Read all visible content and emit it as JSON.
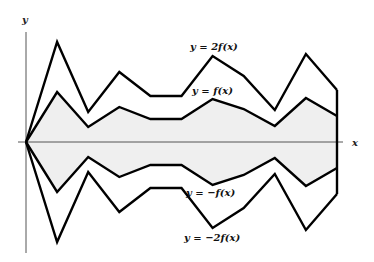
{
  "chart_data": {
    "type": "line",
    "title": "",
    "xlabel": "x",
    "ylabel": "y",
    "grid": false,
    "x": [
      0,
      1,
      2,
      3,
      4,
      5,
      6,
      7,
      8,
      9,
      10
    ],
    "f_values": [
      0,
      50,
      15,
      35,
      23,
      23,
      43,
      33,
      16,
      44,
      26
    ],
    "series": [
      {
        "name": "y = 2f(x)",
        "scale": 2
      },
      {
        "name": "y = f(x)",
        "scale": 1
      },
      {
        "name": "y = -f(x)",
        "scale": -1
      },
      {
        "name": "y = -2f(x)",
        "scale": -2
      }
    ],
    "fill_between": [
      "y = f(x)",
      "y = -f(x)"
    ],
    "fill_color": "#efefef",
    "line_color": "#000000",
    "axis_color": "#555555"
  },
  "labels": {
    "x_axis": "x",
    "y_axis": "y",
    "two_f": "y = 2f(x)",
    "f": "y = f(x)",
    "neg_f": "y = −f(x)",
    "neg_two_f": "y = −2f(x)"
  },
  "layout": {
    "origin_px": [
      26,
      142
    ],
    "x_step_px": 31.1,
    "y_unit_px": 1.0
  }
}
